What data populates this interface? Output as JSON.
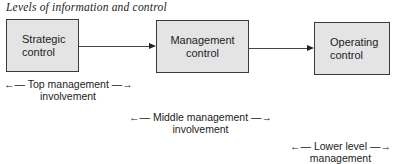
{
  "title": "Levels of information and control",
  "boxes": [
    {
      "line1": "Strategic",
      "line2": "control"
    },
    {
      "line1": "Management",
      "line2": "control"
    },
    {
      "line1": "Operating",
      "line2": "control"
    }
  ],
  "involvement": [
    {
      "line1": "←— Top management —→",
      "line2": "involvement"
    },
    {
      "line1": "←— Middle management —→",
      "line2": "involvement"
    },
    {
      "line1": "←— Lower level —→",
      "line2": "management"
    }
  ],
  "colors": {
    "box_fill": "#e4e4e4",
    "box_border": "#3a3a3a",
    "arrow": "#444444"
  }
}
